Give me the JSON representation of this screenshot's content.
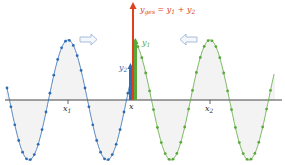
{
  "diagram": {
    "labels": {
      "sum_label": "y_ges = y_1 + y_2",
      "sum_main": "y",
      "sum_sub": "ges",
      "sum_rest": " = y",
      "sum_rest_sub1": "1",
      "sum_plus": " + y",
      "sum_rest_sub2": "2",
      "y1_main": "y",
      "y1_sub": "1",
      "y2_main": "y",
      "y2_sub": "2",
      "x_label": "x",
      "x1_main": "x",
      "x1_sub": "1",
      "x2_main": "x",
      "x2_sub": "2"
    },
    "waves": [
      {
        "name": "wave-1",
        "color": "#2e6db4",
        "direction": "right",
        "center_label": "x1"
      },
      {
        "name": "wave-2",
        "color": "#5aa83a",
        "direction": "left",
        "center_label": "x2"
      }
    ],
    "colors": {
      "sum_arrow": "#e0401c",
      "axis": "#333333",
      "hatch": "#c8c8c8",
      "direction_arrow": "#9fb6d8"
    }
  }
}
